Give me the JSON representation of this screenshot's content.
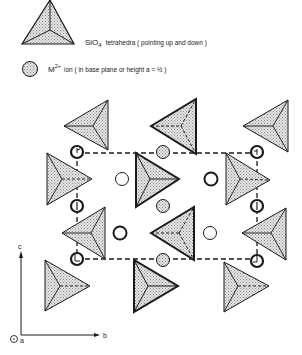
{
  "legend": {
    "tetrahedra_label": "SiO",
    "tetrahedra_sub": "4",
    "tetrahedra_desc": "tetrahedra ( pointing up and down )",
    "ion_label": "M",
    "ion_sup": "2+",
    "ion_desc": "ion  ( in base plane or height  a = ½ )"
  },
  "axes": {
    "c": "c",
    "b": "b",
    "a": "a"
  },
  "colors": {
    "stroke": "#1a1a1a",
    "shade": "#c8c8c8",
    "background": "#ffffff"
  }
}
